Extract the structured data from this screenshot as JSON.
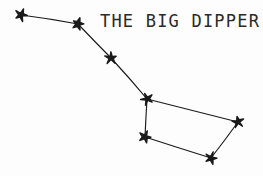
{
  "figure": {
    "name": "The Big Dipper constellation diagram",
    "background_color": "#fdfdfd",
    "ink_color": "#1a1a1a",
    "width": 263,
    "height": 176
  },
  "title": {
    "text": "THE BIG DIPPER",
    "x": 100,
    "y": 27,
    "color": "#2a2a2a"
  },
  "chart_data": {
    "type": "scatter",
    "title": "THE BIG DIPPER",
    "xlabel": "",
    "ylabel": "",
    "xlim": [
      0,
      263
    ],
    "ylim": [
      0,
      176
    ],
    "grid": false,
    "legend": null,
    "stars": [
      {
        "id": "star-1",
        "label": "handle-tip",
        "x": 21,
        "y": 15
      },
      {
        "id": "star-2",
        "label": "handle-2",
        "x": 78,
        "y": 24
      },
      {
        "id": "star-3",
        "label": "handle-3",
        "x": 111,
        "y": 58
      },
      {
        "id": "star-4",
        "label": "bowl-top-left",
        "x": 147,
        "y": 99
      },
      {
        "id": "star-5",
        "label": "bowl-bottom-left",
        "x": 145,
        "y": 137
      },
      {
        "id": "star-6",
        "label": "bowl-top-right",
        "x": 238,
        "y": 122
      },
      {
        "id": "star-7",
        "label": "bowl-bottom-right",
        "x": 211,
        "y": 158
      }
    ],
    "connections": [
      {
        "id": "line-1",
        "from": "star-1",
        "to": "star-2"
      },
      {
        "id": "line-2",
        "from": "star-2",
        "to": "star-3"
      },
      {
        "id": "line-3",
        "from": "star-3",
        "to": "star-4"
      },
      {
        "id": "line-4",
        "from": "star-4",
        "to": "star-5"
      },
      {
        "id": "line-5",
        "from": "star-4",
        "to": "star-6"
      },
      {
        "id": "line-6",
        "from": "star-5",
        "to": "star-7"
      },
      {
        "id": "line-7",
        "from": "star-7",
        "to": "star-6"
      }
    ]
  }
}
